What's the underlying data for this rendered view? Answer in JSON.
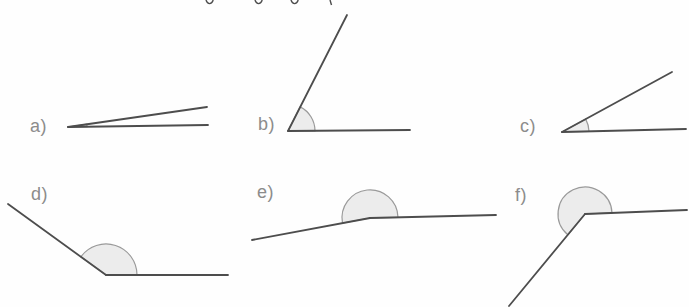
{
  "page": {
    "description_of_content": "worksheet strip with six drawn angles to estimate, labelled a) to f), each with a light grey shaded angle sector at the vertex",
    "paper_color": "#fefefe"
  },
  "colors": {
    "ray_stroke": "#4d4d4d",
    "arc_stroke": "#9a9a9a",
    "arc_fill": "#ececec",
    "label_color": "#8c8c8c",
    "fragment_color": "#4d4d4d"
  },
  "figures": [
    {
      "id": "a",
      "label": "a)",
      "angle_deg_estimate": 8,
      "angle_type": "acute",
      "vertex": [
        68,
        127
      ],
      "ray1_end": [
        208,
        125
      ],
      "ray2_end": [
        207,
        107
      ],
      "arc_radius": 19
    },
    {
      "id": "b",
      "label": "b)",
      "angle_deg_estimate": 63,
      "angle_type": "acute",
      "vertex": [
        288,
        131
      ],
      "ray1_end": [
        410,
        130
      ],
      "ray2_end": [
        347,
        15
      ],
      "arc_radius": 27
    },
    {
      "id": "c",
      "label": "c)",
      "angle_deg_estimate": 29,
      "angle_type": "acute",
      "vertex": [
        562,
        132
      ],
      "ray1_end": [
        686,
        129
      ],
      "ray2_end": [
        672,
        72
      ],
      "arc_radius": 27
    },
    {
      "id": "d",
      "label": "d)",
      "angle_deg_estimate": 144,
      "angle_type": "obtuse",
      "vertex": [
        106,
        275
      ],
      "ray1_end": [
        228,
        275
      ],
      "ray2_end": [
        8,
        204
      ],
      "arc_radius": 31
    },
    {
      "id": "e",
      "label": "e)",
      "angle_deg_estimate": 190,
      "angle_type": "reflex",
      "vertex": [
        370,
        218
      ],
      "ray1_end": [
        496,
        215
      ],
      "ray2_end": [
        252,
        240
      ],
      "arc_radius": 28
    },
    {
      "id": "f",
      "label": "f)",
      "angle_deg_estimate": 229,
      "angle_type": "reflex",
      "vertex": [
        585,
        214
      ],
      "ray1_end": [
        687,
        210
      ],
      "ray2_end": [
        509,
        306
      ],
      "arc_radius": 27
    }
  ],
  "top_edge_artifacts": {
    "note": "descender tips of a cropped-off text line at the very top edge",
    "descender_xs": [
      206,
      255,
      291
    ],
    "tick_x": 330
  }
}
